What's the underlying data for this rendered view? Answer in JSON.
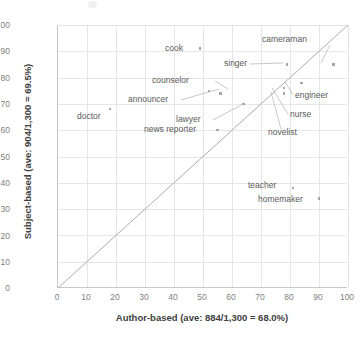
{
  "chart_data": {
    "type": "scatter",
    "title": "",
    "xlabel": "Author-based (ave: 884/1,300 = 68.0%)",
    "ylabel": "Subject-based (ave: 904/1,300 = 69.5%)",
    "xlim": [
      0,
      100
    ],
    "ylim": [
      0,
      100
    ],
    "xticks": [
      "0",
      "10",
      "20",
      "30",
      "40",
      "50",
      "60",
      "70",
      "80",
      "90",
      "100"
    ],
    "yticks": [
      "0",
      "10",
      "20",
      "30",
      "40",
      "50",
      "60",
      "70",
      "80",
      "90",
      "100"
    ],
    "grid": true,
    "legend": "none",
    "reference_line": {
      "name": "y = x diagonal",
      "from": [
        0,
        0
      ],
      "to": [
        100,
        100
      ]
    },
    "marker_color": "#a6a6a6",
    "grid_color": "#e6e6e6",
    "axis_color": "#c8c8c8",
    "points": [
      {
        "label": "cook",
        "x": 49,
        "y": 91,
        "label_pos": "left"
      },
      {
        "label": "doctor",
        "x": 18,
        "y": 68,
        "label_pos": "left"
      },
      {
        "label": "counselor",
        "x": 52,
        "y": 75,
        "label_pos": "leader"
      },
      {
        "label": "announcer",
        "x": 56,
        "y": 74,
        "label_pos": "leader"
      },
      {
        "label": "lawyer",
        "x": 64,
        "y": 70,
        "label_pos": "leader"
      },
      {
        "label": "news reporter",
        "x": 55,
        "y": 60,
        "label_pos": "left"
      },
      {
        "label": "singer",
        "x": 79,
        "y": 85,
        "label_pos": "leader"
      },
      {
        "label": "cameraman",
        "x": 95,
        "y": 85,
        "label_pos": "leader"
      },
      {
        "label": "engineer",
        "x": 84,
        "y": 78,
        "label_pos": "leader"
      },
      {
        "label": "nurse",
        "x": 78,
        "y": 76,
        "label_pos": "leader"
      },
      {
        "label": "novelist",
        "x": 78,
        "y": 74,
        "label_pos": "leader"
      },
      {
        "label": "teacher",
        "x": 81,
        "y": 38,
        "label_pos": "left"
      },
      {
        "label": "homemaker",
        "x": 90,
        "y": 34,
        "label_pos": "left"
      }
    ]
  }
}
